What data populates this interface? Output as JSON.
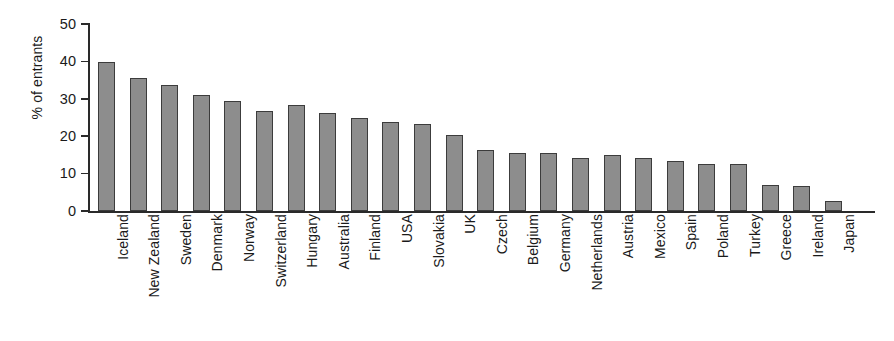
{
  "chart_data": {
    "type": "bar",
    "title": "",
    "xlabel": "",
    "ylabel": "% of entrants",
    "ylim": [
      0,
      50
    ],
    "yticks": [
      0,
      10,
      20,
      30,
      40,
      50
    ],
    "grid": false,
    "legend": null,
    "bar_color": "#8d8d8d",
    "bar_edge_color": "#3c3c3c",
    "categories": [
      "Iceland",
      "New Zealand",
      "Sweden",
      "Denmark",
      "Norway",
      "Switzerland",
      "Hungary",
      "Australia",
      "Finland",
      "USA",
      "Slovakia",
      "UK",
      "Czech",
      "Belgium",
      "Germany",
      "Netherlands",
      "Austria",
      "Mexico",
      "Spain",
      "Poland",
      "Turkey",
      "Greece",
      "Ireland",
      "Japan"
    ],
    "values": [
      39.8,
      35.5,
      33.6,
      31.0,
      29.3,
      26.8,
      28.3,
      26.3,
      24.8,
      23.7,
      23.3,
      20.3,
      16.4,
      15.5,
      15.5,
      14.1,
      14.9,
      14.1,
      13.3,
      12.6,
      12.6,
      7.0,
      6.8,
      2.6
    ]
  }
}
